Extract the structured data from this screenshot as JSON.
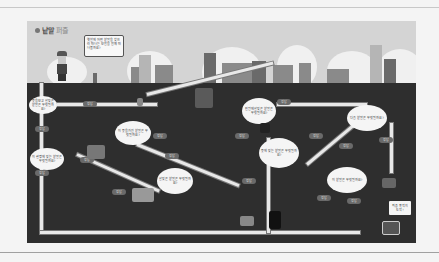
{
  "title": {
    "main": "낱말",
    "sub": "퍼즐"
  },
  "intro_speech": "옛날에 어떤 낱말을 찾으러 떠나는 모험을 함께 떠나볼까요?",
  "colors": {
    "sky": "#d4d4d4",
    "ground": "#2e2e2e",
    "road": "#e8e8e8",
    "pill": "#6a6a6a",
    "page_bg": "#f4f4f4"
  },
  "bubbles": [
    {
      "text": "뜻을 보고 알맞은 낱말은 무엇일까요?"
    },
    {
      "text": "이 뜻을 가진 낱말은 무엇일까요?"
    },
    {
      "text": "이 설명에 맞는 낱말은 무엇일까요?"
    },
    {
      "text": "알맞은 낱말은 무엇일까요?"
    },
    {
      "text": "빈칸에 알맞은 낱말은 무엇일까요?"
    },
    {
      "text": "뜻에 맞는 낱말은 무엇일까요?"
    },
    {
      "text": "다음 낱말은 무엇일까요?"
    },
    {
      "text": "이 낱말은 무엇일까요?"
    }
  ],
  "pills": [
    "정답",
    "정답",
    "정답",
    "정답",
    "정답",
    "정답",
    "정답",
    "정답",
    "정답",
    "정답",
    "정답",
    "정답",
    "정답",
    "정답",
    "정답"
  ],
  "goal_sign": "최종 목적지 도착!"
}
